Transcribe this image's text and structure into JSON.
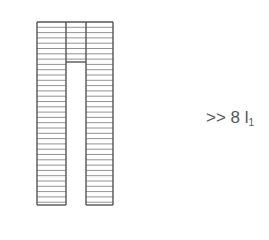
{
  "diagram": {
    "stroke_color": "#555555",
    "rung_color": "#777777",
    "outline": {
      "left": 37,
      "top": 22,
      "right": 113,
      "bottom": 205
    },
    "left_flight": {
      "x1": 37,
      "x2": 66
    },
    "middle_landing": {
      "x1": 66,
      "x2": 86,
      "bottom": 62
    },
    "right_flight": {
      "x1": 86,
      "x2": 113
    },
    "rung_spacing": 5.3
  },
  "annotation": {
    "prefix": ">> 8 l",
    "subscript": "1"
  }
}
